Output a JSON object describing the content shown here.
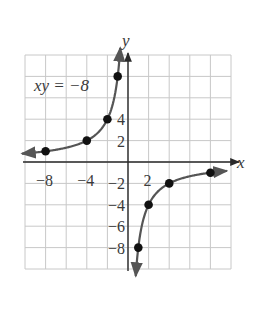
{
  "chart_data": {
    "type": "line",
    "title": "",
    "equation_label": "xy = −8",
    "function": "y = -8/x",
    "xlabel": "x",
    "ylabel": "y",
    "xlim": [
      -10,
      10
    ],
    "ylim": [
      -10,
      10
    ],
    "grid": true,
    "grid_step": 2,
    "x_tick_labels": [
      {
        "value": -8,
        "text": "−8"
      },
      {
        "value": -4,
        "text": "−4"
      },
      {
        "value": 2,
        "text": "2"
      }
    ],
    "y_tick_labels": [
      {
        "value": 4,
        "text": "4"
      },
      {
        "value": 2,
        "text": "2"
      },
      {
        "value": -2,
        "text": "−2"
      },
      {
        "value": -4,
        "text": "−4"
      },
      {
        "value": -6,
        "text": "−6"
      },
      {
        "value": -8,
        "text": "−8"
      }
    ],
    "series": [
      {
        "name": "left branch",
        "points": [
          [
            -8,
            1
          ],
          [
            -4,
            2
          ],
          [
            -2,
            4
          ],
          [
            -1,
            8
          ]
        ]
      },
      {
        "name": "right branch",
        "points": [
          [
            1,
            -8
          ],
          [
            2,
            -4
          ],
          [
            4,
            -2
          ],
          [
            8,
            -1
          ]
        ]
      }
    ]
  },
  "colors": {
    "grid": "#c8c8c8",
    "axis": "#2a2a2a",
    "curve": "#555555",
    "point": "#111111",
    "text": "#3a3a3a"
  }
}
